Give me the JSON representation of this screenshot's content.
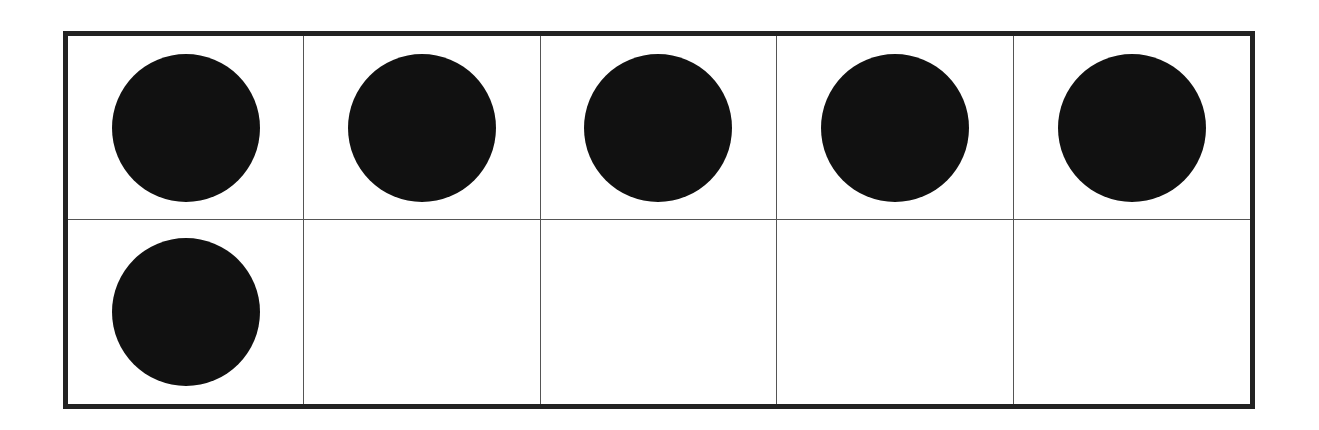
{
  "diagram": {
    "type": "ten-frame",
    "rows": 2,
    "columns": 5,
    "filled_count": 6,
    "total_cells": 10,
    "counter_color": "#111111",
    "border_color": "#222222",
    "cells": [
      {
        "row": 1,
        "col": 1,
        "filled": true
      },
      {
        "row": 1,
        "col": 2,
        "filled": true
      },
      {
        "row": 1,
        "col": 3,
        "filled": true
      },
      {
        "row": 1,
        "col": 4,
        "filled": true
      },
      {
        "row": 1,
        "col": 5,
        "filled": true
      },
      {
        "row": 2,
        "col": 1,
        "filled": true
      },
      {
        "row": 2,
        "col": 2,
        "filled": false
      },
      {
        "row": 2,
        "col": 3,
        "filled": false
      },
      {
        "row": 2,
        "col": 4,
        "filled": false
      },
      {
        "row": 2,
        "col": 5,
        "filled": false
      }
    ]
  }
}
